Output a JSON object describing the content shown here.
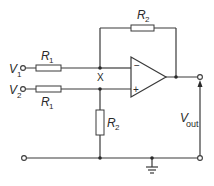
{
  "diagram": {
    "type": "op-amp differential amplifier circuit",
    "inputs": [
      {
        "name": "V",
        "sub": "1"
      },
      {
        "name": "V",
        "sub": "2"
      }
    ],
    "output": {
      "name": "V",
      "sub": "out"
    },
    "resistors": [
      {
        "id": "r1-top",
        "name": "R",
        "sub": "1"
      },
      {
        "id": "r1-bottom",
        "name": "R",
        "sub": "1"
      },
      {
        "id": "r2-feedback",
        "name": "R",
        "sub": "2"
      },
      {
        "id": "r2-ground",
        "name": "R",
        "sub": "2"
      }
    ],
    "node_label": "X",
    "opamp": {
      "inverting": "−",
      "non_inverting": "+"
    },
    "colors": {
      "line": "#3a3a3a",
      "background": "#ffffff"
    }
  }
}
